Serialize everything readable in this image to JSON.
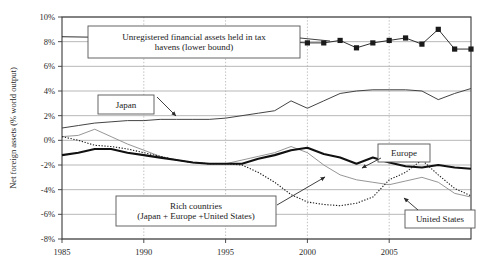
{
  "chart_data": {
    "type": "line",
    "title": "",
    "xlabel": "",
    "ylabel": "Net foreign assets (% world output)",
    "xlim": [
      1985,
      2010
    ],
    "ylim": [
      -8,
      10
    ],
    "xticks": [
      "1985",
      "1990",
      "1995",
      "2000",
      "2005"
    ],
    "xtick_values": [
      1985,
      1990,
      1995,
      2000,
      2005
    ],
    "yticks": [
      "10%",
      "8%",
      "6%",
      "4%",
      "2%",
      "0%",
      "-2%",
      "-4%",
      "-6%",
      "-8%"
    ],
    "ytick_values": [
      10,
      8,
      6,
      4,
      2,
      0,
      -2,
      -4,
      -6,
      -8
    ],
    "grid": "horizontal solid gray, vertical dotted gray",
    "legend_position": "inline annotation boxes with arrows",
    "series": [
      {
        "name": "Unregistered financial assets held in tax havens (lower bound)",
        "style": "thin line with filled square markers",
        "x": [
          1985,
          1990,
          1995,
          2000,
          2001,
          2002,
          2003,
          2004,
          2005,
          2006,
          2007,
          2008,
          2009,
          2010
        ],
        "values": [
          8.4,
          8.3,
          8.2,
          7.9,
          7.9,
          8.1,
          7.5,
          7.9,
          8.1,
          8.3,
          7.8,
          9.0,
          7.4,
          7.4
        ]
      },
      {
        "name": "Japan",
        "style": "thin solid line",
        "x": [
          1985,
          1986,
          1987,
          1988,
          1989,
          1990,
          1991,
          1992,
          1993,
          1994,
          1995,
          1996,
          1997,
          1998,
          1999,
          2000,
          2001,
          2002,
          2003,
          2004,
          2005,
          2006,
          2007,
          2008,
          2009,
          2010
        ],
        "values": [
          1.0,
          1.2,
          1.4,
          1.5,
          1.6,
          1.6,
          1.7,
          1.7,
          1.7,
          1.7,
          1.8,
          2.0,
          2.2,
          2.4,
          3.2,
          2.6,
          3.2,
          3.8,
          4.0,
          4.1,
          4.1,
          4.1,
          4.0,
          3.3,
          3.8,
          4.2
        ]
      },
      {
        "name": "Europe",
        "style": "thick solid black line",
        "x": [
          1985,
          1986,
          1987,
          1988,
          1989,
          1990,
          1991,
          1992,
          1993,
          1994,
          1995,
          1996,
          1997,
          1998,
          1999,
          2000,
          2001,
          2002,
          2003,
          2004,
          2005,
          2006,
          2007,
          2008,
          2009,
          2010
        ],
        "values": [
          -1.2,
          -1.0,
          -0.7,
          -0.7,
          -1.0,
          -1.2,
          -1.4,
          -1.6,
          -1.8,
          -1.9,
          -1.9,
          -1.9,
          -1.5,
          -1.2,
          -0.8,
          -0.6,
          -1.1,
          -1.4,
          -1.9,
          -1.4,
          -1.8,
          -2.1,
          -2.2,
          -2.0,
          -2.2,
          -2.3
        ]
      },
      {
        "name": "United States",
        "style": "dotted line",
        "x": [
          1985,
          1986,
          1987,
          1988,
          1989,
          1990,
          1991,
          1992,
          1993,
          1994,
          1995,
          1996,
          1997,
          1998,
          1999,
          2000,
          2001,
          2002,
          2003,
          2004,
          2005,
          2006,
          2007,
          2008,
          2009,
          2010
        ],
        "values": [
          0.3,
          0.0,
          -0.4,
          -0.5,
          -0.7,
          -1.0,
          -1.3,
          -1.6,
          -1.8,
          -1.9,
          -1.9,
          -2.0,
          -2.6,
          -3.4,
          -4.4,
          -5.0,
          -5.2,
          -5.3,
          -5.1,
          -4.6,
          -3.2,
          -2.6,
          -1.6,
          -2.8,
          -3.9,
          -4.5
        ]
      },
      {
        "name": "Rich countries (Japan + Europe + United States)",
        "style": "thin gray line",
        "x": [
          1985,
          1986,
          1987,
          1988,
          1989,
          1990,
          1991,
          1992,
          1993,
          1994,
          1995,
          1996,
          1997,
          1998,
          1999,
          2000,
          2001,
          2002,
          2003,
          2004,
          2005,
          2006,
          2007,
          2008,
          2009,
          2010
        ],
        "values": [
          0.3,
          0.4,
          0.9,
          0.3,
          -0.3,
          -0.8,
          -1.3,
          -1.6,
          -1.8,
          -1.9,
          -1.9,
          -1.6,
          -1.3,
          -1.0,
          -0.5,
          -1.0,
          -2.0,
          -2.8,
          -3.2,
          -3.4,
          -3.6,
          -3.3,
          -3.0,
          -3.4,
          -4.3,
          -4.6
        ]
      }
    ],
    "annotations": [
      {
        "id": "tax-havens",
        "line1": "Unregistered financial assets held in tax",
        "line2": "havens (lower bound)"
      },
      {
        "id": "japan",
        "line1": "Japan",
        "line2": ""
      },
      {
        "id": "rich-countries",
        "line1": "Rich countries",
        "line2": "(Japan + Europe +United States)"
      },
      {
        "id": "europe",
        "line1": "Europe",
        "line2": ""
      },
      {
        "id": "united-states",
        "line1": "United States",
        "line2": ""
      }
    ],
    "colors": {
      "axis": "#3a3a3a",
      "grid_solid": "#9a9a9a",
      "grid_dotted": "#b0b0b0",
      "europe_line": "#111111",
      "japan_line": "#3a3a3a",
      "us_line": "#1a1a1a",
      "rich_line": "#8a8a8a",
      "tax_haven_line": "#1a1a1a",
      "box_border": "#555555",
      "background": "#ffffff"
    }
  }
}
